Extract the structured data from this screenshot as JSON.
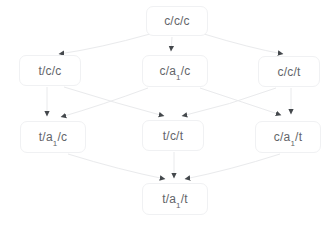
{
  "diagram": {
    "type": "state-lattice",
    "nodes": [
      {
        "id": "ccc",
        "pre": "c/c/c",
        "sub": "",
        "post": ""
      },
      {
        "id": "tcc",
        "pre": "t/c/c",
        "sub": "",
        "post": ""
      },
      {
        "id": "ca1c",
        "pre": "c/a",
        "sub": "1",
        "post": "/c"
      },
      {
        "id": "cct",
        "pre": "c/c/t",
        "sub": "",
        "post": ""
      },
      {
        "id": "ta1c",
        "pre": "t/a",
        "sub": "1",
        "post": "/c"
      },
      {
        "id": "tct",
        "pre": "t/c/t",
        "sub": "",
        "post": ""
      },
      {
        "id": "ca1t",
        "pre": "c/a",
        "sub": "1",
        "post": "/t"
      },
      {
        "id": "ta1t",
        "pre": "t/a",
        "sub": "1",
        "post": "/t"
      }
    ],
    "edges": [
      {
        "from": "c/c/c",
        "to": "t/c/c"
      },
      {
        "from": "c/c/c",
        "to": "c/a1/c"
      },
      {
        "from": "c/c/c",
        "to": "c/c/t"
      },
      {
        "from": "t/c/c",
        "to": "t/a1/c"
      },
      {
        "from": "c/a1/c",
        "to": "t/a1/c"
      },
      {
        "from": "t/c/c",
        "to": "t/c/t"
      },
      {
        "from": "c/c/t",
        "to": "t/c/t"
      },
      {
        "from": "c/a1/c",
        "to": "c/a1/t"
      },
      {
        "from": "c/c/t",
        "to": "c/a1/t"
      },
      {
        "from": "t/a1/c",
        "to": "t/a1/t"
      },
      {
        "from": "t/c/t",
        "to": "t/a1/t"
      },
      {
        "from": "c/a1/t",
        "to": "t/a1/t"
      }
    ],
    "colors": {
      "node_text": "#636569",
      "node_border": "#f0f1f3",
      "edge_line": "#e9eaec",
      "arrowhead": "#44484c",
      "background": "#ffffff"
    }
  }
}
